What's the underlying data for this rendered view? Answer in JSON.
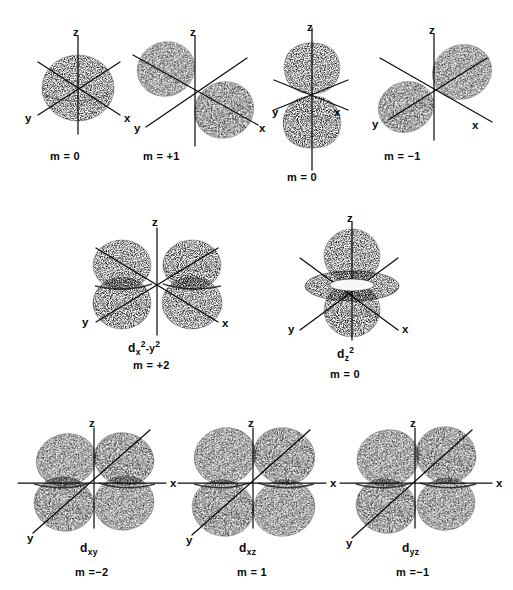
{
  "figure": {
    "background_color": "#ffffff",
    "ink_color": "#111111",
    "style": "stippled halftone line drawing"
  },
  "rows": [
    {
      "row_name": "s-and-p-orbitals",
      "orbitals": [
        {
          "id": "s-orbital",
          "shape": "sphere",
          "orbital_label": "",
          "m_label": "m = 0",
          "axes": [
            {
              "name": "z",
              "label": "z"
            },
            {
              "name": "y",
              "label": "y"
            },
            {
              "name": "x",
              "label": "x"
            }
          ]
        },
        {
          "id": "p-x-orbital",
          "shape": "two-lobes-along-x",
          "orbital_label": "",
          "m_label": "m = +1",
          "axes": [
            {
              "name": "z",
              "label": "z"
            },
            {
              "name": "y",
              "label": "y"
            },
            {
              "name": "x",
              "label": "x"
            }
          ]
        },
        {
          "id": "p-z-orbital",
          "shape": "two-lobes-along-z",
          "orbital_label": "",
          "m_label": "m = 0",
          "axes": [
            {
              "name": "z",
              "label": "z"
            },
            {
              "name": "y",
              "label": "y"
            },
            {
              "name": "x",
              "label": "x"
            }
          ]
        },
        {
          "id": "p-y-orbital",
          "shape": "two-lobes-along-y",
          "orbital_label": "",
          "m_label": "m = −1",
          "axes": [
            {
              "name": "z",
              "label": "z"
            },
            {
              "name": "y",
              "label": "y"
            },
            {
              "name": "x",
              "label": "x"
            }
          ]
        }
      ]
    },
    {
      "row_name": "d-x2-y2-and-d-z2",
      "orbitals": [
        {
          "id": "d-x2-y2-orbital",
          "shape": "four-lobes-in-xy-plane",
          "orbital_label_parts": {
            "d": "d",
            "sub1": "x",
            "sup1": "2",
            "mid": "-y",
            "sup2": "2"
          },
          "orbital_label_plain": "dx2 -y2",
          "m_label": "m = +2",
          "axes": [
            {
              "name": "z",
              "label": "z"
            },
            {
              "name": "y",
              "label": "y"
            },
            {
              "name": "x",
              "label": "x"
            }
          ]
        },
        {
          "id": "d-z2-orbital",
          "shape": "two-lobes-along-z-with-torus",
          "orbital_label_parts": {
            "d": "d",
            "sub1": "z",
            "sup1": "2"
          },
          "orbital_label_plain": "dz2",
          "m_label": "m = 0",
          "axes": [
            {
              "name": "z",
              "label": "z"
            },
            {
              "name": "y",
              "label": "y"
            },
            {
              "name": "x",
              "label": "x"
            }
          ]
        }
      ]
    },
    {
      "row_name": "d-xy-d-xz-d-yz",
      "orbitals": [
        {
          "id": "d-xy-orbital",
          "shape": "four-lobes-between-axes",
          "orbital_label_parts": {
            "d": "d",
            "sub1": "xy"
          },
          "orbital_label_plain": "dxy",
          "m_label": "m =−2",
          "axes": [
            {
              "name": "z",
              "label": "z"
            },
            {
              "name": "y",
              "label": "y"
            },
            {
              "name": "x",
              "label": "x"
            }
          ]
        },
        {
          "id": "d-xz-orbital",
          "shape": "four-lobes-between-axes",
          "orbital_label_parts": {
            "d": "d",
            "sub1": "xz"
          },
          "orbital_label_plain": "dxz",
          "m_label": "m = 1",
          "axes": [
            {
              "name": "z",
              "label": "z"
            },
            {
              "name": "y",
              "label": "y"
            },
            {
              "name": "x",
              "label": "x"
            }
          ]
        },
        {
          "id": "d-yz-orbital",
          "shape": "four-lobes-between-axes",
          "orbital_label_parts": {
            "d": "d",
            "sub1": "yz"
          },
          "orbital_label_plain": "dyz",
          "m_label": "m =−1",
          "axes": [
            {
              "name": "z",
              "label": "z"
            },
            {
              "name": "y",
              "label": "y"
            },
            {
              "name": "x",
              "label": "x"
            }
          ]
        }
      ]
    }
  ],
  "footer": {
    "cropped_caption": ""
  }
}
